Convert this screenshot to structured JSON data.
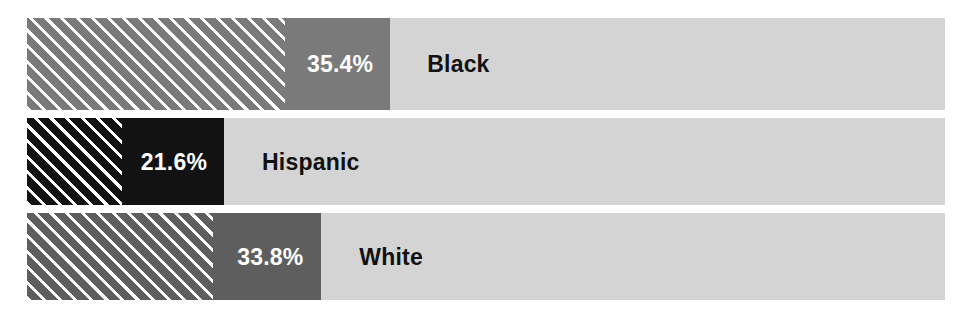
{
  "chart_data": {
    "type": "bar",
    "orientation": "horizontal",
    "title": "",
    "subtitle": "",
    "xlabel": "",
    "ylabel": "",
    "xlim": [
      0,
      100
    ],
    "grid": false,
    "legend": false,
    "value_suffix": "%",
    "categories": [
      "Black",
      "Hispanic",
      "White"
    ],
    "values": [
      35.4,
      21.6,
      33.8
    ],
    "value_labels": [
      "35.4%",
      "21.6%",
      "33.8%"
    ],
    "series": [
      {
        "name": "Share",
        "values": [
          35.4,
          21.6,
          33.8
        ]
      }
    ],
    "bars": [
      {
        "category": "Black",
        "value": 35.4,
        "value_label": "35.4%",
        "fill_color": "#7a7a7a",
        "hatch_color": "#ffffff",
        "track_color": "#d4d4d4",
        "value_label_color": "#ffffff",
        "category_label_color": "#111111",
        "fill_pct": 39.5,
        "hatch_pct": 28.1,
        "value_label_left_pct": 30.5,
        "category_label_left_pct": 43.6
      },
      {
        "category": "Hispanic",
        "value": 21.6,
        "value_label": "21.6%",
        "fill_color": "#121212",
        "hatch_color": "#ffffff",
        "track_color": "#d4d4d4",
        "value_label_color": "#ffffff",
        "category_label_color": "#111111",
        "fill_pct": 21.5,
        "hatch_pct": 10.4,
        "value_label_left_pct": 12.4,
        "category_label_left_pct": 25.6
      },
      {
        "category": "White",
        "value": 33.8,
        "value_label": "33.8%",
        "fill_color": "#5e5e5e",
        "hatch_color": "#ffffff",
        "track_color": "#d4d4d4",
        "value_label_color": "#ffffff",
        "category_label_color": "#111111",
        "fill_pct": 32.0,
        "hatch_pct": 20.3,
        "value_label_left_pct": 22.9,
        "category_label_left_pct": 36.2
      }
    ],
    "colors": {
      "background": "#ffffff",
      "track": "#d4d4d4",
      "black_bar": "#7a7a7a",
      "hispanic_bar": "#121212",
      "white_bar": "#5e5e5e",
      "hatch_stripe": "#ffffff",
      "category_text": "#111111",
      "value_text": "#ffffff"
    }
  }
}
